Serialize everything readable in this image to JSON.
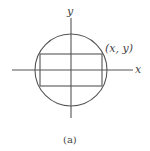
{
  "figure": {
    "x_axis_label": "x",
    "y_axis_label": "y",
    "point_label": "(x, y)",
    "caption": "(a)",
    "stroke_color": "#555555"
  },
  "geometry": {
    "circle": {
      "cx": 71,
      "cy": 70,
      "r": 36
    },
    "rectangle": {
      "x": 40,
      "y": 54,
      "width": 62,
      "height": 32
    },
    "x_axis": {
      "x1": 12,
      "x2": 133,
      "y": 70
    },
    "y_axis": {
      "x": 71,
      "y1": 18,
      "y2": 118
    }
  }
}
